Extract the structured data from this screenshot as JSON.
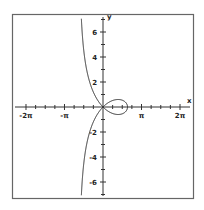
{
  "chart_data": {
    "type": "line",
    "title": "",
    "xlabel": "x",
    "ylabel": "y",
    "xlim": [
      -7.0,
      7.1
    ],
    "ylim": [
      -7.4,
      7.4
    ],
    "grid": false,
    "legend": null,
    "x_ticks": [
      {
        "value": -6.2832,
        "label": "-2π"
      },
      {
        "value": -3.1416,
        "label": "-π"
      },
      {
        "value": 3.1416,
        "label": "π"
      },
      {
        "value": 6.2832,
        "label": "2π"
      }
    ],
    "x_minor_tick_step": 0.7854,
    "y_ticks": [
      {
        "value": 6,
        "label": "6"
      },
      {
        "value": 4,
        "label": "4"
      },
      {
        "value": 2,
        "label": "2"
      },
      {
        "value": -2,
        "label": "-2"
      },
      {
        "value": -4,
        "label": "-4"
      },
      {
        "value": -6,
        "label": "-6"
      }
    ],
    "y_minor_tick_step": 1,
    "series": [
      {
        "name": "strophoid y^2 = x^2 (a - x)/(a + x), a = 2",
        "equation": "y^2 = x^2 (2 - x) / (2 + x)",
        "parameter_a": 2,
        "asymptote_x": -2,
        "loop_x_range": [
          0,
          2
        ],
        "color": "#222222"
      }
    ]
  },
  "axis_labels": {
    "x": "x",
    "y": "y"
  },
  "colors": {
    "frame": "#666666",
    "axis": "#333333",
    "curve": "#222222"
  }
}
